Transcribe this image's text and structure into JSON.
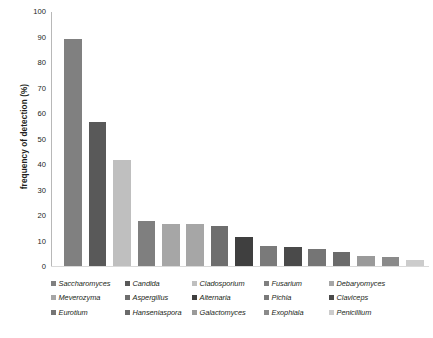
{
  "chart_data": {
    "type": "bar",
    "title": "",
    "xlabel": "",
    "ylabel": "frequency of detection (%)",
    "ylim": [
      0,
      100
    ],
    "yticks": [
      0,
      10,
      20,
      30,
      40,
      50,
      60,
      70,
      80,
      90,
      100
    ],
    "ytick_labels": [
      "0",
      "10",
      "20",
      "30",
      "40",
      "50",
      "60",
      "70",
      "80",
      "90",
      "100"
    ],
    "grid": false,
    "legend_position": "bottom",
    "categories": [
      "Saccharomyces",
      "Candida",
      "Cladosporium",
      "Fusarium",
      "Debaryomyces",
      "Meverozyma",
      "Aspergillus",
      "Alternaria",
      "Pichia",
      "Claviceps",
      "Eurotium",
      "Hanseniaspora",
      "Galactomyces",
      "Exophiala",
      "Penicillium"
    ],
    "values": [
      89,
      56.5,
      41.5,
      17.5,
      16.5,
      16.5,
      15.5,
      11.5,
      8,
      7.5,
      6.5,
      5.5,
      4,
      3.5,
      2.5
    ],
    "colors": [
      "#808080",
      "#595959",
      "#bfbfbf",
      "#7f7f7f",
      "#a6a6a6",
      "#a6a6a6",
      "#6e6e6e",
      "#3f3f3f",
      "#7a7a7a",
      "#4a4a4a",
      "#757575",
      "#6b6b6b",
      "#9a9a9a",
      "#8a8a8a",
      "#cccccc"
    ]
  },
  "legend": {
    "entries": [
      {
        "label": "Saccharomyces",
        "color": "#808080"
      },
      {
        "label": "Candida",
        "color": "#595959"
      },
      {
        "label": "Cladosporium",
        "color": "#bfbfbf"
      },
      {
        "label": "Fusarium",
        "color": "#7f7f7f"
      },
      {
        "label": "Debaryomyces",
        "color": "#a6a6a6"
      },
      {
        "label": "Meverozyma",
        "color": "#a6a6a6"
      },
      {
        "label": "Aspergillus",
        "color": "#6e6e6e"
      },
      {
        "label": "Alternaria",
        "color": "#3f3f3f"
      },
      {
        "label": "Pichia",
        "color": "#7a7a7a"
      },
      {
        "label": "Claviceps",
        "color": "#4a4a4a"
      },
      {
        "label": "Eurotium",
        "color": "#757575"
      },
      {
        "label": "Hanseniaspora",
        "color": "#6b6b6b"
      },
      {
        "label": "Galactomyces",
        "color": "#9a9a9a"
      },
      {
        "label": "Exophiala",
        "color": "#8a8a8a"
      },
      {
        "label": "Penicillium",
        "color": "#cccccc"
      }
    ]
  }
}
